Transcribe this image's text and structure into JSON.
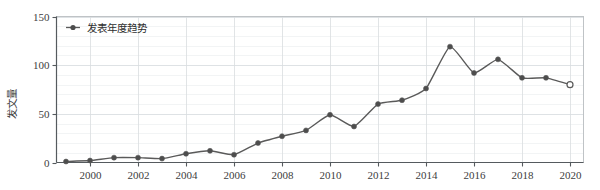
{
  "chart_data": {
    "type": "line",
    "title": "",
    "subtitle": "",
    "xlabel": "",
    "ylabel": "发文量",
    "legend": [
      "发表年度趋势"
    ],
    "legend_position": "top-left",
    "grid": true,
    "xlim": [
      1999,
      2020
    ],
    "ylim": [
      0,
      150
    ],
    "yticks": [
      0,
      50,
      100,
      150
    ],
    "ytick_labels": [
      "0",
      "50",
      "100",
      "150"
    ],
    "xticks": [
      2000,
      2002,
      2004,
      2006,
      2008,
      2010,
      2012,
      2014,
      2016,
      2018,
      2020
    ],
    "xtick_labels": [
      "2000",
      "2002",
      "2004",
      "2006",
      "2008",
      "2010",
      "2012",
      "2014",
      "2016",
      "2018",
      "2020"
    ],
    "series": [
      {
        "name": "发表年度趋势",
        "color": "#5a5a5a",
        "marker": "circle",
        "x": [
          1999,
          2000,
          2001,
          2002,
          2003,
          2004,
          2005,
          2006,
          2007,
          2008,
          2009,
          2010,
          2011,
          2012,
          2013,
          2014,
          2015,
          2016,
          2017,
          2018,
          2019,
          2020
        ],
        "values": [
          1,
          2,
          5,
          5,
          4,
          9,
          12,
          8,
          20,
          27,
          33,
          49,
          37,
          60,
          64,
          76,
          119,
          92,
          106,
          87,
          87,
          80
        ]
      }
    ],
    "annotations": [
      {
        "label": "last-point-open-marker",
        "x": 2020,
        "y": 80
      }
    ]
  },
  "axis": {
    "y_title": "发文量",
    "y_labels": [
      "150",
      "100",
      "50",
      "0"
    ],
    "x_labels": [
      "2000",
      "2002",
      "2004",
      "2006",
      "2008",
      "2010",
      "2012",
      "2014",
      "2016",
      "2018",
      "2020"
    ]
  },
  "legend": {
    "marker_name": "legend-marker-icon",
    "label": "发表年度趋势"
  },
  "colors": {
    "line": "#5a5a5a",
    "marker_fill": "#4d4d4d",
    "last_marker_fill": "#ffffff",
    "grid_minor": "#eceff1",
    "grid_major": "#d6dade",
    "axis": "#555a5e",
    "text": "#3a3a3a"
  }
}
